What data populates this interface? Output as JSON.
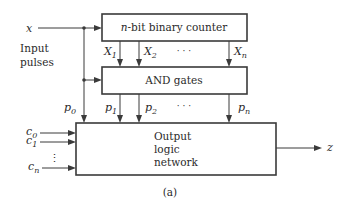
{
  "diagram": {
    "caption": "(a)",
    "input": {
      "signal": "x",
      "label_line1": "Input",
      "label_line2": "pulses"
    },
    "blocks": {
      "counter": {
        "label_prefix": "n",
        "label_rest": "-bit binary counter"
      },
      "and_gates": {
        "label": "AND gates"
      },
      "output_network": {
        "line1": "Output",
        "line2": "logic",
        "line3": "network"
      }
    },
    "counter_outputs": [
      {
        "name": "X",
        "sub": "1"
      },
      {
        "name": "X",
        "sub": "2"
      },
      {
        "name": "X",
        "sub": "n"
      }
    ],
    "counter_ellipsis": "· · ·",
    "gate_outputs": [
      {
        "name": "p",
        "sub": "0"
      },
      {
        "name": "p",
        "sub": "1"
      },
      {
        "name": "p",
        "sub": "2"
      },
      {
        "name": "p",
        "sub": "n"
      }
    ],
    "gate_ellipsis": "· · ·",
    "control_inputs": [
      {
        "name": "c",
        "sub": "0"
      },
      {
        "name": "c",
        "sub": "1"
      },
      {
        "name": "c",
        "sub": "n"
      }
    ],
    "control_ellipsis": "⋮",
    "output": {
      "signal": "z"
    }
  }
}
